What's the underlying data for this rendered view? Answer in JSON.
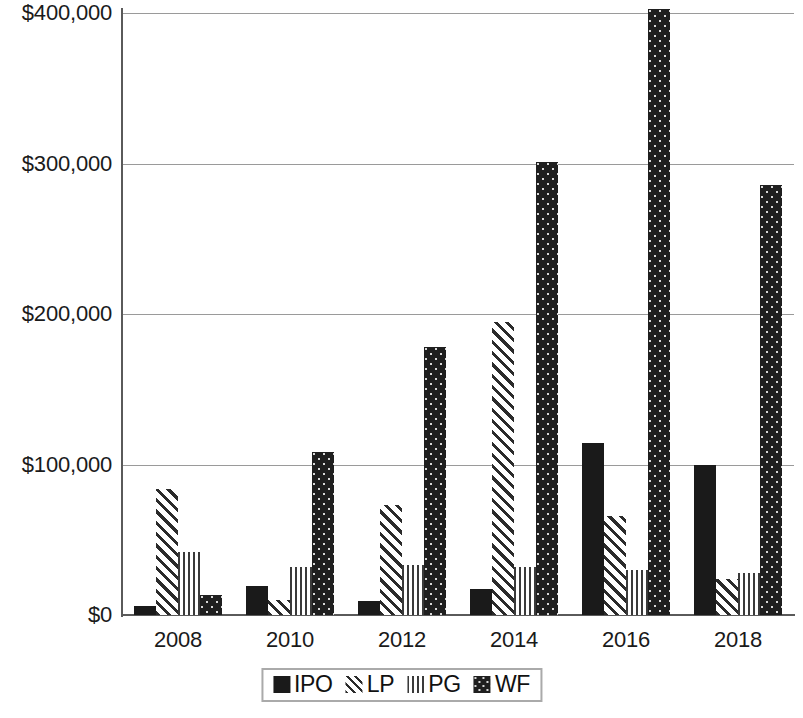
{
  "chart_data": {
    "type": "bar",
    "title": "",
    "subtitle": "",
    "xlabel": "",
    "ylabel": "",
    "ylim": [
      0,
      400000
    ],
    "yticks": [
      0,
      100000,
      200000,
      300000,
      400000
    ],
    "ytick_labels": [
      "$0",
      "$100,000",
      "$200,000",
      "$300,000",
      "$400,000"
    ],
    "grid": true,
    "grid_axis": "y",
    "legend_position": "bottom",
    "categories": [
      "2008",
      "2009",
      "2010",
      "2011",
      "2012",
      "2013"
    ],
    "xtick_labels": [
      "2008",
      "2010",
      "2012",
      "2014",
      "2016",
      "2018"
    ],
    "series": [
      {
        "name": "IPO",
        "pattern": "solid",
        "color": "#1a1a1a",
        "values": [
          6000,
          19000,
          9000,
          17000,
          114000,
          100000
        ]
      },
      {
        "name": "LP",
        "pattern": "diagonal-hatch",
        "color": "#2b2b2b",
        "values": [
          84000,
          10000,
          73000,
          195000,
          66000,
          24000
        ]
      },
      {
        "name": "PG",
        "pattern": "vertical-lines",
        "color": "#3a3a3a",
        "values": [
          42000,
          32000,
          33000,
          32000,
          30000,
          28000
        ]
      },
      {
        "name": "WF",
        "pattern": "dotted-fill",
        "color": "#1f1f1f",
        "values": [
          13000,
          108000,
          178000,
          301000,
          403000,
          286000
        ]
      }
    ]
  },
  "legend": {
    "items": [
      {
        "label": "IPO",
        "swatch": "solid-square-icon"
      },
      {
        "label": "LP",
        "swatch": "diagonal-hatch-square-icon"
      },
      {
        "label": "PG",
        "swatch": "vertical-lines-square-icon"
      },
      {
        "label": "WF",
        "swatch": "dotted-square-icon"
      }
    ]
  }
}
